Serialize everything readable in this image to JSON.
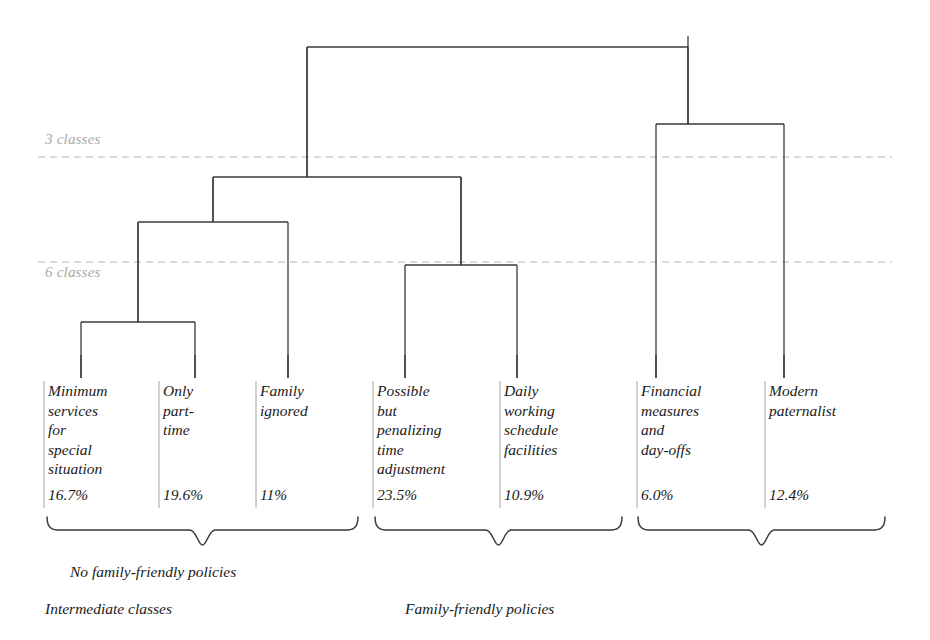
{
  "figure": {
    "type": "dendrogram",
    "orientation": "top-down",
    "background": "#ffffff",
    "line_color": "#3a3a3a",
    "cut_line_color": "#b4b4b4",
    "text_color": "#1a1a1a"
  },
  "cut_levels": [
    {
      "id": "cut-3",
      "label": "3 classes",
      "y": 157,
      "label_x": 45,
      "label_y": 131
    },
    {
      "id": "cut-6",
      "label": "6 classes",
      "y": 262,
      "label_x": 45,
      "label_y": 264
    }
  ],
  "leaves": [
    {
      "id": "leaf-1",
      "name": "Minimum\nservices\nfor special\n  situation",
      "percent": "16.7%",
      "stem_x": 81,
      "col_left": 48,
      "col_divider_x": 44,
      "text_x": 48
    },
    {
      "id": "leaf-2",
      "name": "Only part-\ntime",
      "percent": "19.6%",
      "stem_x": 195,
      "col_left": 163,
      "col_divider_x": 159,
      "text_x": 163
    },
    {
      "id": "leaf-3",
      "name": "Family\nignored",
      "percent": "11%",
      "stem_x": 288,
      "col_left": 260,
      "col_divider_x": 256,
      "text_x": 260
    },
    {
      "id": "leaf-4",
      "name": "Possible but\npenalizing time\nadjustment",
      "percent": "23.5%",
      "stem_x": 405,
      "col_left": 377,
      "col_divider_x": 373,
      "text_x": 377
    },
    {
      "id": "leaf-5",
      "name": "Daily working\nschedule\nfacilities",
      "percent": "10.9%",
      "stem_x": 517,
      "col_left": 504,
      "col_divider_x": 500,
      "text_x": 504
    },
    {
      "id": "leaf-6",
      "name": "Financial\nmeasures and\nday-offs",
      "percent": "6.0%",
      "stem_x": 656,
      "col_left": 641,
      "col_divider_x": 637,
      "text_x": 641
    },
    {
      "id": "leaf-7",
      "name": "Modern\npaternalist",
      "percent": "12.4%",
      "stem_x": 784,
      "col_left": 769,
      "col_divider_x": 765,
      "text_x": 769
    }
  ],
  "leaf_layout": {
    "stem_top": 355,
    "stem_bottom": 378,
    "name_top": 381,
    "divider_top": 381,
    "divider_bottom": 508,
    "percent_y": 485
  },
  "merges": [
    {
      "id": "merge-a",
      "note": "Minimum services + Only part-time",
      "y": 322,
      "left_x": 81,
      "right_x": 195,
      "parent_x": 138,
      "children_bottom": 378
    },
    {
      "id": "merge-b",
      "note": "(A) + Family ignored",
      "y": 222,
      "left_x": 138,
      "right_x": 288,
      "parent_x": 213,
      "children_bottom": 378
    },
    {
      "id": "merge-c",
      "note": "Possible but penalizing + Daily working schedule",
      "y": 265,
      "left_x": 405,
      "right_x": 517,
      "parent_x": 461,
      "children_bottom": 378
    },
    {
      "id": "merge-d",
      "note": "(B) + (C) = no family-friendly + intermediate",
      "y": 177,
      "left_x": 213,
      "right_x": 461,
      "parent_x": 307,
      "children_bottom": 378
    },
    {
      "id": "merge-e",
      "note": "Financial measures + Modern paternalist",
      "y": 124,
      "left_x": 656,
      "right_x": 784,
      "parent_x": 688,
      "children_bottom": 378
    },
    {
      "id": "merge-root",
      "note": "root: (D) + (E)",
      "y": 47,
      "left_x": 307,
      "right_x": 688,
      "parent_x": 688,
      "stub_top": 36
    }
  ],
  "braces": [
    {
      "id": "brace-1",
      "left": 47,
      "right": 358,
      "top": 517,
      "depth": 28,
      "label": "No family-friendly policies",
      "label_x": 70,
      "label_y": 563
    },
    {
      "id": "brace-2",
      "left": 375,
      "right": 622,
      "top": 517,
      "depth": 28,
      "label": "",
      "label_x": 0,
      "label_y": 0
    },
    {
      "id": "brace-3",
      "left": 638,
      "right": 885,
      "top": 517,
      "depth": 28,
      "label": "",
      "label_x": 0,
      "label_y": 0
    }
  ],
  "group_captions": [
    {
      "id": "caption-intermediate",
      "label": "Intermediate classes",
      "x": 45,
      "y": 600
    },
    {
      "id": "caption-family-friendly",
      "label": "Family-friendly policies",
      "x": 405,
      "y": 600
    }
  ]
}
